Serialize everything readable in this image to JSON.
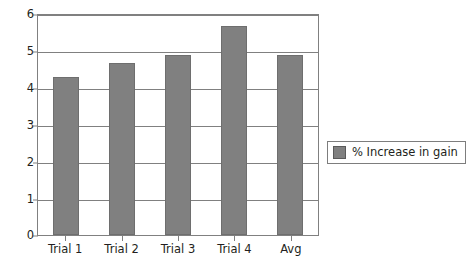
{
  "chart_data": {
    "type": "bar",
    "title": "",
    "xlabel": "",
    "ylabel": "",
    "categories": [
      "Trial 1",
      "Trial 2",
      "Trial 3",
      "Trial 4",
      "Avg"
    ],
    "values": [
      4.3,
      4.7,
      4.9,
      5.7,
      4.9
    ],
    "series": [
      {
        "name": "% Increase in gain",
        "values": [
          4.3,
          4.7,
          4.9,
          5.7,
          4.9
        ],
        "color": "#808080"
      }
    ],
    "ylim": [
      0,
      6
    ],
    "yticks": [
      0,
      1,
      2,
      3,
      4,
      5,
      6
    ],
    "ytick_labels": [
      "0",
      "1",
      "2",
      "3",
      "4",
      "5",
      "6"
    ],
    "grid": true,
    "grid_axis": "y",
    "legend": {
      "position": "right",
      "entries": [
        {
          "label": "% Increase in gain",
          "color": "#808080"
        }
      ]
    },
    "colors": {
      "bar_fill": "#808080",
      "bar_edge": "#6e6e6e",
      "axis": "#808080",
      "grid": "#808080",
      "text": "#231f20",
      "background": "#ffffff",
      "legend_border": "#7d7d7d"
    }
  }
}
